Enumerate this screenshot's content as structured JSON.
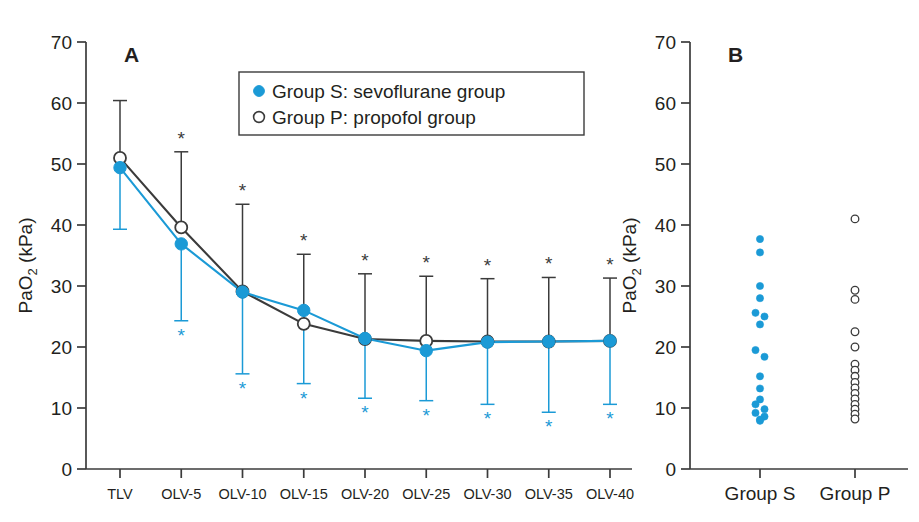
{
  "figure": {
    "background": "#ffffff",
    "width": 919,
    "height": 522
  },
  "colors": {
    "group_s": "#1B9AD6",
    "group_p": "#3b3b3b",
    "axis": "#3b3b3b",
    "text": "#231f20"
  },
  "panelA": {
    "letter": "A",
    "ylabel_main": "Pa",
    "ylabel_sub": "O",
    "ylabel_sub2": "2",
    "ylabel_unit": " (kPa)",
    "ylabel_full": "PaO2 (kPa)",
    "yticks": [
      "70",
      "60",
      "50",
      "40",
      "30",
      "20",
      "10",
      "0"
    ],
    "xticks": [
      "TLV",
      "OLV-5",
      "OLV-10",
      "OLV-15",
      "OLV-20",
      "OLV-25",
      "OLV-30",
      "OLV-35",
      "OLV-40"
    ],
    "legend": {
      "group_s_label": "Group S: sevoflurane group",
      "group_p_label": "Group P: propofol group"
    },
    "significance_marker": "*"
  },
  "panelB": {
    "letter": "B",
    "ylabel_full": "PaO2 (kPa)",
    "yticks": [
      "70",
      "60",
      "50",
      "40",
      "30",
      "20",
      "10",
      "0"
    ],
    "xticks": [
      "Group S",
      "Group P"
    ]
  },
  "chart_data": [
    {
      "type": "line",
      "id": "panel-A",
      "title": "A",
      "xlabel": "",
      "ylabel": "PaO2 (kPa)",
      "ylim": [
        0,
        70
      ],
      "ytick_step": 10,
      "grid": false,
      "legend_position": "top-center",
      "categories": [
        "TLV",
        "OLV-5",
        "OLV-10",
        "OLV-15",
        "OLV-20",
        "OLV-25",
        "OLV-30",
        "OLV-35",
        "OLV-40"
      ],
      "series": [
        {
          "name": "Group S: sevoflurane group",
          "marker": "filled-circle",
          "color": "#1B9AD6",
          "values": [
            49.4,
            36.9,
            29.0,
            26.0,
            21.4,
            19.4,
            20.8,
            20.9,
            21.0
          ],
          "error_low": [
            39.3,
            24.3,
            15.6,
            14.0,
            11.6,
            11.2,
            10.6,
            9.3,
            10.6
          ],
          "error_direction": "down",
          "significant": [
            false,
            true,
            true,
            true,
            true,
            true,
            true,
            true,
            true
          ]
        },
        {
          "name": "Group P: propofol group",
          "marker": "open-circle",
          "color": "#3b3b3b",
          "values": [
            51.0,
            39.6,
            29.1,
            23.8,
            21.3,
            21.0,
            20.9,
            20.9,
            21.0
          ],
          "error_high": [
            60.4,
            52.0,
            43.4,
            35.2,
            32.0,
            31.6,
            31.2,
            31.4,
            31.3
          ],
          "error_direction": "up",
          "significant": [
            false,
            true,
            true,
            true,
            true,
            true,
            true,
            true,
            true
          ]
        }
      ],
      "annotations": [
        "* indicates statistically significant difference"
      ]
    },
    {
      "type": "scatter",
      "id": "panel-B",
      "title": "B",
      "xlabel": "",
      "ylabel": "PaO2 (kPa)",
      "ylim": [
        0,
        70
      ],
      "ytick_step": 10,
      "grid": false,
      "categories": [
        "Group S",
        "Group P"
      ],
      "series": [
        {
          "name": "Group S",
          "marker": "filled-circle",
          "color": "#1B9AD6",
          "values": [
            37.7,
            35.5,
            30.0,
            28.0,
            25.6,
            25.0,
            23.7,
            19.5,
            18.4,
            15.2,
            13.2,
            11.4,
            10.6,
            9.8,
            9.2,
            8.6,
            8.1,
            7.9
          ],
          "jitter": [
            0,
            0,
            0,
            0,
            -1,
            1,
            0,
            -1,
            1,
            0,
            0,
            0,
            -1,
            1,
            -1,
            1,
            0,
            0
          ]
        },
        {
          "name": "Group P",
          "marker": "open-circle",
          "color": "#3b3b3b",
          "values": [
            41.0,
            29.3,
            27.8,
            22.5,
            20.0,
            17.2,
            16.2,
            15.2,
            14.2,
            13.3,
            12.4,
            11.5,
            10.6,
            9.8,
            9.0,
            8.2
          ],
          "jitter": [
            0,
            0,
            0,
            0,
            0,
            0,
            0,
            0,
            0,
            0,
            0,
            0,
            0,
            0,
            0,
            0
          ]
        }
      ]
    }
  ]
}
